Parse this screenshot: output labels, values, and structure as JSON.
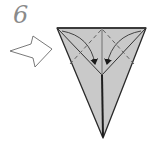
{
  "step": {
    "number": "6"
  },
  "colors": {
    "paper_fill": "#c9c9c9",
    "outline": "#2a2a2a",
    "crease": "#555555",
    "arrow_outline": "#6a6a6a",
    "step_number": "#8a8a8a",
    "background": "#ffffff"
  },
  "symbols": {
    "push_arrow": "hollow-push-arrow-icon",
    "fold_arrows": "curved-fold-arrow-icon",
    "valley_folds": "dashed-valley-fold-lines"
  }
}
